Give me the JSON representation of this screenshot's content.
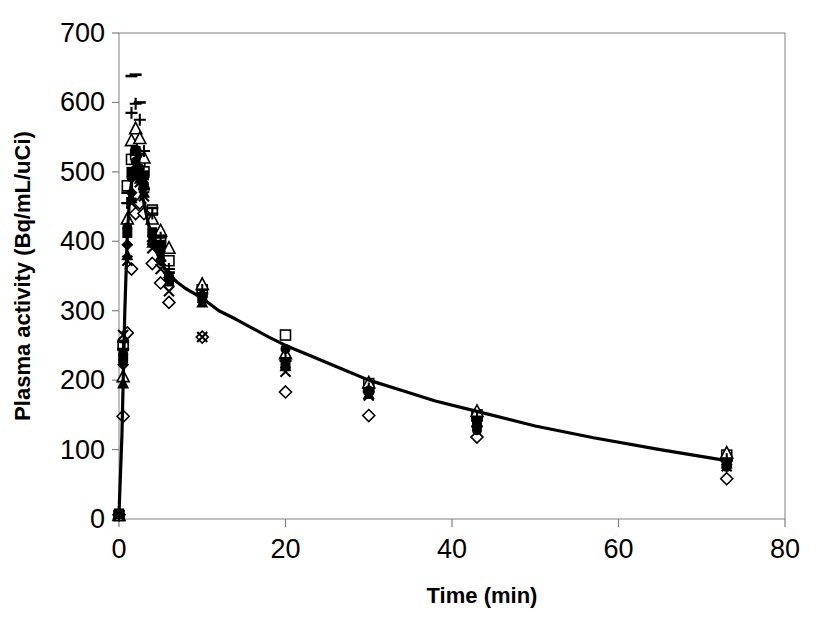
{
  "figure": {
    "background_color": "#ffffff",
    "ink_color": "#000000",
    "axis_line_color": "#808080",
    "plot_area_px": {
      "left": 119,
      "right": 785,
      "top": 33,
      "bottom": 519
    }
  },
  "chart_data": {
    "type": "scatter",
    "title": "",
    "xlabel": "Time (min)",
    "ylabel": "Plasma activity (Bq/mL/uCi)",
    "xlim": [
      0,
      80
    ],
    "ylim": [
      0,
      700
    ],
    "xticks": [
      0,
      20,
      40,
      60,
      80
    ],
    "yticks": [
      0,
      100,
      200,
      300,
      400,
      500,
      600,
      700
    ],
    "xtick_labels": [
      "0",
      "20",
      "40",
      "60",
      "80"
    ],
    "ytick_labels": [
      "0",
      "100",
      "200",
      "300",
      "400",
      "500",
      "600",
      "700"
    ],
    "grid": false,
    "legend": false,
    "legend_position": "none",
    "border_box": true,
    "fitted_curve": {
      "name": "fitted mean curve",
      "style": "solid",
      "width_px": 3.2,
      "color": "#000000",
      "x": [
        0,
        0.35,
        0.7,
        1.0,
        1.3,
        1.6,
        1.9,
        2.1,
        2.4,
        2.7,
        3.0,
        3.4,
        3.8,
        4.3,
        5.0,
        6.0,
        7.0,
        8.0,
        9.0,
        10.0,
        12.0,
        14.0,
        16.0,
        18.0,
        20.0,
        23.0,
        26.0,
        30.0,
        34.0,
        38.0,
        43.0,
        50.0,
        57.0,
        65.0,
        73.0
      ],
      "y": [
        8,
        120,
        300,
        410,
        468,
        492,
        500,
        497,
        487,
        472,
        455,
        432,
        412,
        392,
        370,
        352,
        341,
        332,
        325,
        318,
        300,
        288,
        275,
        262,
        250,
        235,
        220,
        200,
        185,
        170,
        155,
        134,
        117,
        100,
        84
      ]
    },
    "series": [
      {
        "name": "subject-1",
        "marker": "open-square",
        "x": [
          0,
          0.5,
          1,
          1.5,
          2,
          2.5,
          3,
          4,
          5,
          6,
          10,
          20,
          30,
          43,
          73
        ],
        "y": [
          5,
          250,
          480,
          518,
          525,
          512,
          500,
          445,
          400,
          372,
          330,
          265,
          195,
          150,
          92
        ]
      },
      {
        "name": "subject-2",
        "marker": "filled-square",
        "x": [
          0,
          0.5,
          1,
          1.5,
          2,
          2.5,
          3,
          4,
          5,
          6,
          10,
          20,
          30,
          43,
          73
        ],
        "y": [
          8,
          232,
          412,
          500,
          530,
          520,
          495,
          413,
          395,
          345,
          318,
          222,
          186,
          140,
          82
        ]
      },
      {
        "name": "subject-3",
        "marker": "open-diamond",
        "x": [
          0,
          0.5,
          1,
          1.5,
          2,
          2.5,
          3,
          4,
          5,
          6,
          10,
          20,
          30,
          43,
          73
        ],
        "y": [
          6,
          148,
          268,
          360,
          440,
          455,
          440,
          368,
          340,
          312,
          262,
          183,
          149,
          118,
          58
        ]
      },
      {
        "name": "subject-4",
        "marker": "filled-diamond",
        "x": [
          0,
          0.5,
          1,
          1.5,
          2,
          2.5,
          3,
          4,
          5,
          6,
          10,
          20,
          30,
          43,
          73
        ],
        "y": [
          7,
          222,
          395,
          470,
          505,
          498,
          478,
          400,
          372,
          348,
          320,
          228,
          182,
          134,
          78
        ]
      },
      {
        "name": "subject-5",
        "marker": "open-triangle",
        "x": [
          0,
          0.5,
          1,
          1.5,
          2,
          2.5,
          3,
          4,
          5,
          6,
          10,
          20,
          30,
          43,
          73
        ],
        "y": [
          5,
          205,
          432,
          545,
          562,
          548,
          520,
          432,
          415,
          390,
          338,
          238,
          196,
          155,
          95
        ]
      },
      {
        "name": "subject-6",
        "marker": "filled-triangle",
        "x": [
          0,
          0.5,
          1,
          1.5,
          2,
          2.5,
          3,
          4,
          5,
          6,
          10,
          20,
          30,
          43,
          73
        ],
        "y": [
          8,
          195,
          380,
          462,
          498,
          490,
          470,
          398,
          378,
          342,
          312,
          220,
          180,
          140,
          80
        ]
      },
      {
        "name": "subject-7",
        "marker": "filled-circle",
        "x": [
          0,
          0.5,
          1,
          1.5,
          2,
          2.5,
          3,
          4,
          5,
          6,
          10,
          20,
          30,
          43,
          73
        ],
        "y": [
          6,
          238,
          420,
          492,
          515,
          505,
          482,
          408,
          385,
          350,
          322,
          245,
          185,
          128,
          75
        ]
      },
      {
        "name": "subject-8",
        "marker": "cross-x",
        "x": [
          0,
          0.5,
          1,
          1.5,
          2,
          2.5,
          3,
          4,
          5,
          6,
          10,
          20,
          30,
          43,
          73
        ],
        "y": [
          5,
          265,
          372,
          455,
          492,
          485,
          465,
          390,
          360,
          328,
          262,
          212,
          178,
          138,
          76
        ]
      },
      {
        "name": "subject-9",
        "marker": "plus",
        "x": [
          0,
          0.5,
          1,
          1.5,
          2,
          2.5,
          3,
          4,
          5,
          6,
          10,
          20,
          30,
          43,
          73
        ],
        "y": [
          7,
          245,
          455,
          585,
          598,
          575,
          530,
          440,
          405,
          360,
          330,
          232,
          188,
          145,
          86
        ]
      },
      {
        "name": "subject-10",
        "marker": "dash",
        "x": [
          0,
          0.5,
          1,
          1.5,
          2,
          2.5,
          3,
          4,
          5,
          6,
          10,
          20,
          30,
          43,
          73
        ],
        "y": [
          6,
          255,
          470,
          638,
          640,
          600,
          475,
          448,
          408,
          355,
          325,
          228,
          184,
          142,
          84
        ]
      }
    ]
  }
}
